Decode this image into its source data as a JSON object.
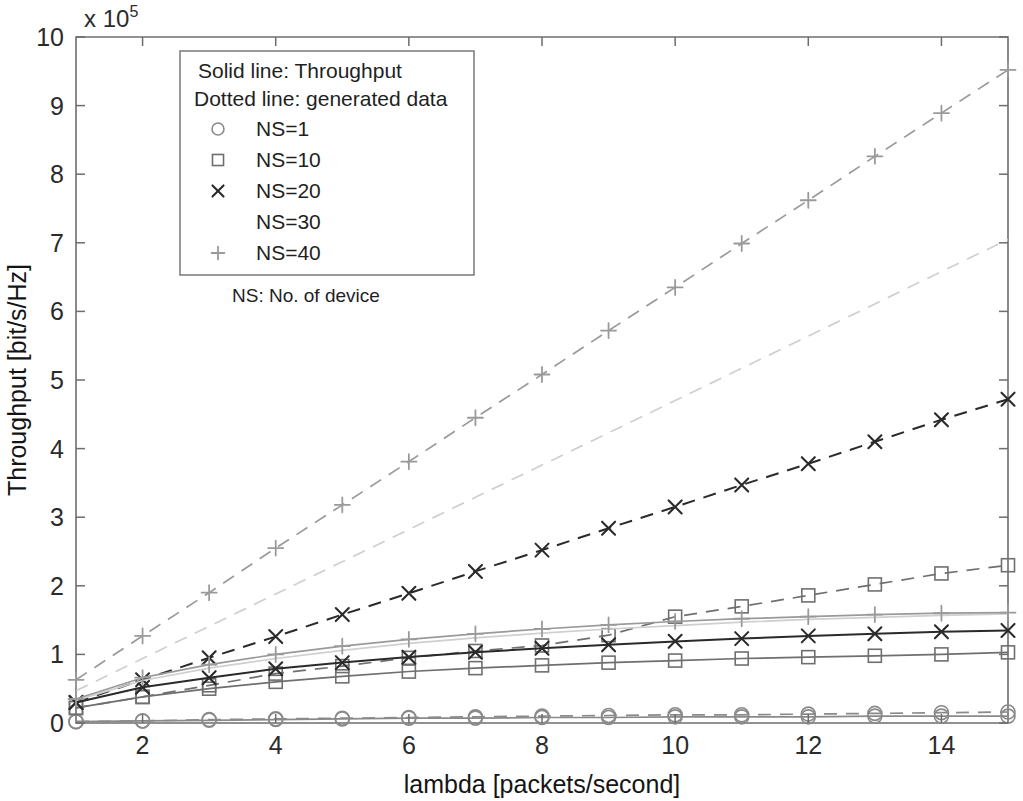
{
  "figure": {
    "background": "#ffffff",
    "axis_color": "#6d6d6d"
  },
  "axes": {
    "y_multiplier": "x 10",
    "y_multiplier_exponent": "5",
    "y_title": "Throughput [bit/s/Hz]",
    "x_title": "lambda [packets/second]",
    "x_ticklabels": [
      "2",
      "4",
      "6",
      "8",
      "10",
      "12",
      "14"
    ],
    "y_ticklabels": [
      "0",
      "1",
      "2",
      "3",
      "4",
      "5",
      "6",
      "7",
      "8",
      "9",
      "10"
    ]
  },
  "legend": {
    "line_note_solid": "Solid line: Throughput",
    "line_note_dotted": "Dotted line: generated data",
    "entries": [
      {
        "label": "NS=1",
        "marker": "circle",
        "color": "#8a8a8a"
      },
      {
        "label": "NS=10",
        "marker": "square",
        "color": "#6f6f6f"
      },
      {
        "label": "NS=20",
        "marker": "cross",
        "color": "#2a2a2a"
      },
      {
        "label": "NS=30",
        "marker": "dot",
        "color": "#cfcfcf"
      },
      {
        "label": "NS=40",
        "marker": "plus",
        "color": "#9a9a9a"
      }
    ],
    "footnote": "NS: No. of device"
  },
  "chart_data": {
    "type": "line",
    "title": "",
    "xlabel": "lambda [packets/second]",
    "ylabel": "Throughput [bit/s/Hz]",
    "y_multiplier": 100000,
    "xlim": [
      1,
      15
    ],
    "ylim": [
      0,
      10
    ],
    "xticks": [
      2,
      4,
      6,
      8,
      10,
      12,
      14
    ],
    "yticks": [
      0,
      1,
      2,
      3,
      4,
      5,
      6,
      7,
      8,
      9,
      10
    ],
    "grid": false,
    "legend_position": "upper-left-inside",
    "x": [
      1,
      2,
      3,
      4,
      5,
      6,
      7,
      8,
      9,
      10,
      11,
      12,
      13,
      14,
      15
    ],
    "series": [
      {
        "name": "NS=1 throughput",
        "style": "solid",
        "marker": "circle",
        "color": "#8a8a8a",
        "values": [
          0.02,
          0.03,
          0.04,
          0.05,
          0.06,
          0.07,
          0.07,
          0.08,
          0.08,
          0.09,
          0.09,
          0.09,
          0.1,
          0.1,
          0.1
        ]
      },
      {
        "name": "NS=1 generated data",
        "style": "dashed",
        "marker": "circle",
        "color": "#8a8a8a",
        "values": [
          0.02,
          0.03,
          0.05,
          0.06,
          0.07,
          0.08,
          0.09,
          0.1,
          0.11,
          0.12,
          0.12,
          0.13,
          0.14,
          0.15,
          0.16
        ]
      },
      {
        "name": "NS=10 throughput",
        "style": "solid",
        "marker": "square",
        "color": "#6f6f6f",
        "values": [
          0.22,
          0.38,
          0.5,
          0.6,
          0.68,
          0.75,
          0.8,
          0.84,
          0.88,
          0.91,
          0.94,
          0.96,
          0.98,
          1.0,
          1.03
        ]
      },
      {
        "name": "NS=10 generated data",
        "style": "dashed",
        "marker": "square",
        "color": "#6f6f6f",
        "values": [
          0.22,
          0.38,
          0.55,
          0.72,
          0.83,
          0.95,
          1.05,
          1.13,
          1.28,
          1.55,
          1.7,
          1.86,
          2.02,
          2.18,
          2.3
        ]
      },
      {
        "name": "NS=20 throughput",
        "style": "solid",
        "marker": "cross",
        "color": "#2a2a2a",
        "values": [
          0.3,
          0.52,
          0.66,
          0.79,
          0.88,
          0.96,
          1.03,
          1.09,
          1.14,
          1.19,
          1.23,
          1.27,
          1.3,
          1.33,
          1.35
        ]
      },
      {
        "name": "NS=20 generated data",
        "style": "dashed",
        "marker": "cross",
        "color": "#2a2a2a",
        "values": [
          0.3,
          0.63,
          0.95,
          1.26,
          1.58,
          1.89,
          2.21,
          2.52,
          2.84,
          3.15,
          3.47,
          3.78,
          4.1,
          4.42,
          4.72
        ]
      },
      {
        "name": "NS=30 throughput",
        "style": "solid",
        "marker": "dot",
        "color": "#cfcfcf",
        "values": [
          0.33,
          0.62,
          0.8,
          0.94,
          1.06,
          1.16,
          1.24,
          1.31,
          1.37,
          1.42,
          1.47,
          1.51,
          1.54,
          1.57,
          1.59
        ]
      },
      {
        "name": "NS=30 generated data",
        "style": "dashed",
        "marker": "dot",
        "color": "#cfcfcf",
        "values": [
          0.47,
          0.94,
          1.41,
          1.88,
          2.35,
          2.82,
          3.29,
          3.76,
          4.23,
          4.7,
          5.17,
          5.64,
          6.11,
          6.58,
          7.05
        ]
      },
      {
        "name": "NS=40 throughput",
        "style": "solid",
        "marker": "plus",
        "color": "#9a9a9a",
        "values": [
          0.35,
          0.66,
          0.85,
          1.0,
          1.12,
          1.22,
          1.3,
          1.37,
          1.43,
          1.48,
          1.52,
          1.55,
          1.58,
          1.6,
          1.61
        ]
      },
      {
        "name": "NS=40 generated data",
        "style": "dashed",
        "marker": "plus",
        "color": "#9a9a9a",
        "values": [
          0.63,
          1.27,
          1.9,
          2.55,
          3.18,
          3.81,
          4.45,
          5.08,
          5.72,
          6.35,
          6.99,
          7.62,
          8.26,
          8.89,
          9.52
        ]
      }
    ]
  }
}
